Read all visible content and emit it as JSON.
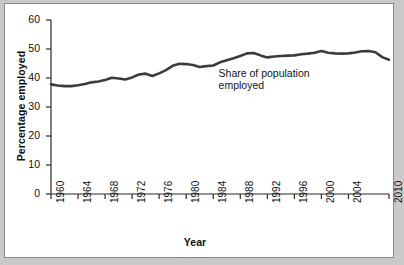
{
  "chart_data": {
    "type": "line",
    "title": "",
    "xlabel": "Year",
    "ylabel": "Percentage employed",
    "xlim": [
      1960,
      2010
    ],
    "ylim": [
      0,
      60
    ],
    "grid": false,
    "legend": "none",
    "annotations": [
      {
        "text": "Share of population\nemployed",
        "x": 1991,
        "y": 44
      }
    ],
    "y_ticks": [
      0,
      10,
      20,
      30,
      40,
      50,
      60
    ],
    "x_ticks": [
      1960,
      1964,
      1968,
      1972,
      1976,
      1980,
      1984,
      1988,
      1992,
      1996,
      2000,
      2004,
      2010
    ],
    "series": [
      {
        "name": "Share of population employed",
        "color": "#3c3c3c",
        "x": [
          1960,
          1961,
          1962,
          1963,
          1964,
          1965,
          1966,
          1967,
          1968,
          1969,
          1970,
          1971,
          1972,
          1973,
          1974,
          1975,
          1976,
          1977,
          1978,
          1979,
          1980,
          1981,
          1982,
          1983,
          1984,
          1985,
          1986,
          1987,
          1988,
          1989,
          1990,
          1991,
          1992,
          1993,
          1994,
          1995,
          1996,
          1997,
          1998,
          1999,
          2000,
          2001,
          2002,
          2003,
          2004,
          2005,
          2006,
          2007,
          2008,
          2009,
          2010
        ],
        "values": [
          37.8,
          37.4,
          37.2,
          37.2,
          37.5,
          37.9,
          38.5,
          38.8,
          39.3,
          40.1,
          39.8,
          39.5,
          40.2,
          41.2,
          41.5,
          40.7,
          41.6,
          42.7,
          44.2,
          44.9,
          44.8,
          44.5,
          43.8,
          44.1,
          44.3,
          45.4,
          46.1,
          46.8,
          47.6,
          48.5,
          48.6,
          47.8,
          47.1,
          47.4,
          47.6,
          47.7,
          47.8,
          48.2,
          48.4,
          48.7,
          49.3,
          48.7,
          48.5,
          48.4,
          48.5,
          48.8,
          49.2,
          49.3,
          48.9,
          47.2,
          46.3
        ]
      }
    ]
  }
}
